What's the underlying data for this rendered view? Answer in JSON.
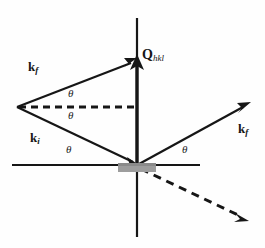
{
  "figure": {
    "background_color": "#fefefe",
    "line_color": "#161616",
    "sample_color": "#9d9d9d",
    "width": 265,
    "height": 248
  },
  "labels": {
    "k_f_upper": {
      "symbol": "k",
      "subscript": "f"
    },
    "k_i": {
      "symbol": "k",
      "subscript": "i"
    },
    "k_f_right": {
      "symbol": "k",
      "subscript": "f"
    },
    "q_vector": {
      "symbol": "Q",
      "subscript": "hkl"
    },
    "theta_1": "θ",
    "theta_2": "θ",
    "theta_3": "θ",
    "theta_4": "θ"
  },
  "geometry": {
    "origin": {
      "x": 137,
      "y": 165
    },
    "apex": {
      "x": 17,
      "y": 107
    },
    "vertical_axis": {
      "x": 137,
      "y_top": 18,
      "y_bottom": 237
    },
    "horizontal_axis": {
      "y": 165,
      "x_left": 12,
      "x_right": 200
    },
    "q_arrow": {
      "x1": 137,
      "y1": 163,
      "x2": 137,
      "y2": 58
    },
    "k_f_upper_arrow": {
      "x1": 17,
      "y1": 107,
      "x2": 136,
      "y2": 60
    },
    "k_i_arrow": {
      "x1": 17,
      "y1": 107,
      "x2": 136,
      "y2": 164
    },
    "k_f_right_arrow": {
      "x1": 139,
      "y1": 164,
      "x2": 249,
      "y2": 103
    },
    "dashed_horizontal": {
      "x1": 19,
      "y1": 107,
      "x2": 137,
      "y2": 107
    },
    "dashed_transmitted": {
      "x1": 140,
      "y1": 168,
      "x2": 246,
      "y2": 220
    },
    "sample": {
      "x": 118,
      "y": 163,
      "width": 38,
      "height": 9
    }
  },
  "annotations": {
    "theta_1_pos": {
      "x": 68,
      "y": 88
    },
    "theta_2_pos": {
      "x": 68,
      "y": 110
    },
    "theta_3_pos": {
      "x": 66,
      "y": 144
    },
    "theta_4_pos": {
      "x": 182,
      "y": 144
    },
    "k_f_upper_pos": {
      "x": 28,
      "y": 60
    },
    "k_i_pos": {
      "x": 30,
      "y": 131
    },
    "k_f_right_pos": {
      "x": 238,
      "y": 122
    },
    "q_label_pos": {
      "x": 142,
      "y": 48
    }
  }
}
